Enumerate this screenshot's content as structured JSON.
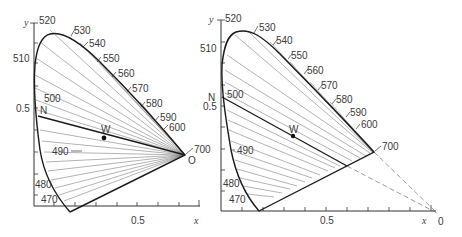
{
  "left_diagram": {
    "axis_x_label": "x",
    "axis_y_label": "y",
    "x_tick_label": "0.5",
    "y_tick_label": "0.5",
    "wavelengths": {
      "w520": "520",
      "w530": "530",
      "w540": "540",
      "w550": "550",
      "w560": "560",
      "w570": "570",
      "w580": "580",
      "w590": "590",
      "w600": "600",
      "w700": "700",
      "w510": "510",
      "w500": "500",
      "w490": "490",
      "w480": "480",
      "w470": "470"
    },
    "point_w": "W",
    "point_n": "N",
    "point_o": "O"
  },
  "right_diagram": {
    "axis_x_label": "x",
    "axis_y_label": "y",
    "x_tick_label": "0.5",
    "y_tick_label": "0.5",
    "wavelengths": {
      "w520": "520",
      "w530": "530",
      "w540": "540",
      "w550": "550",
      "w560": "560",
      "w570": "570",
      "w580": "580",
      "w590": "590",
      "w600": "600",
      "w700": "700",
      "w510": "510",
      "w500": "500",
      "w490": "490",
      "w480": "480",
      "w470": "470"
    },
    "point_w": "W",
    "point_n": "N",
    "point_o": "0"
  }
}
